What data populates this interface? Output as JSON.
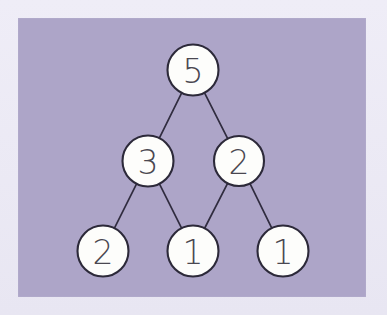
{
  "figure": {
    "kind": "tree-diagram",
    "panel_color": "#ada5c8",
    "mat_color": "#ebe9f4",
    "node_fill": "#fdfdfb",
    "node_stroke": "#2c2939",
    "edge_color": "#302c3f",
    "label_color": "#4a4750"
  },
  "panel": {
    "x": 18,
    "y": 18,
    "width": 348,
    "height": 279
  },
  "nodes": [
    {
      "id": "root",
      "label": "5",
      "cx": 193,
      "cy": 70,
      "r": 25.5,
      "level": 0,
      "name": "tree-node-5-root"
    },
    {
      "id": "n-l",
      "label": "3",
      "cx": 148,
      "cy": 161,
      "r": 25.5,
      "level": 1,
      "name": "tree-node-3-left"
    },
    {
      "id": "n-r",
      "label": "2",
      "cx": 239,
      "cy": 161,
      "r": 25.0,
      "level": 1,
      "name": "tree-node-2-right"
    },
    {
      "id": "n-ll",
      "label": "2",
      "cx": 103,
      "cy": 251,
      "r": 25.5,
      "level": 2,
      "name": "tree-node-2-leaf-left"
    },
    {
      "id": "n-lr",
      "label": "1",
      "cx": 193,
      "cy": 251,
      "r": 25.5,
      "level": 2,
      "name": "tree-node-1-leaf-middle"
    },
    {
      "id": "n-rr",
      "label": "1",
      "cx": 283,
      "cy": 251,
      "r": 25.5,
      "level": 2,
      "name": "tree-node-1-leaf-right"
    }
  ],
  "edges": [
    {
      "from": "root",
      "to": "n-l",
      "name": "tree-edge-root-to-left"
    },
    {
      "from": "root",
      "to": "n-r",
      "name": "tree-edge-root-to-right"
    },
    {
      "from": "n-l",
      "to": "n-ll",
      "name": "tree-edge-left-to-leaf-left"
    },
    {
      "from": "n-l",
      "to": "n-lr",
      "name": "tree-edge-left-to-leaf-middle"
    },
    {
      "from": "n-r",
      "to": "n-lr",
      "name": "tree-edge-right-to-leaf-middle"
    },
    {
      "from": "n-r",
      "to": "n-rr",
      "name": "tree-edge-right-to-leaf-right"
    }
  ]
}
